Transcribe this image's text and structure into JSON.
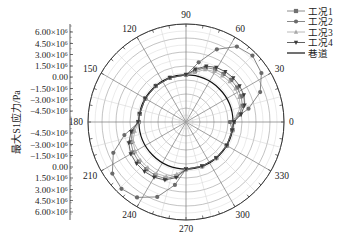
{
  "chart_data": {
    "type": "polar-line",
    "title": "",
    "radial_axis": {
      "label": "最大S1应力/Pa",
      "tick_labels_upper": [
        "6.00×10⁶",
        "4.50×10⁶",
        "3.00×10⁶",
        "1.50×10⁶",
        "0.00",
        "−1.50×10⁶",
        "−3.00×10⁶",
        "−4.50×10⁶"
      ],
      "tick_labels_lower": [
        "−4.50×10⁶",
        "−3.00×10⁶",
        "−1.50×10⁶",
        "0.00",
        "1.50×10⁶",
        "3.00×10⁶",
        "4.50×10⁶",
        "6.00×10⁶"
      ],
      "unit_scale": 1000000,
      "range": [
        -6.0,
        7.2
      ]
    },
    "angular_axis": {
      "tick_labels": [
        "0",
        "30",
        "60",
        "90",
        "120",
        "150",
        "180",
        "210",
        "240",
        "270",
        "300",
        "330"
      ],
      "tick_angles_deg": [
        0,
        30,
        60,
        90,
        120,
        150,
        180,
        210,
        240,
        270,
        300,
        330
      ],
      "direction": "counterclockwise"
    },
    "grid": true,
    "legend": {
      "position": "top-right",
      "entries": [
        "工况1",
        "工况2",
        "工况3",
        "工况4",
        "巷道"
      ]
    },
    "tunnel_value": 0.33,
    "series": [
      {
        "name": "工况1",
        "marker": "square",
        "color": "#707070",
        "points": [
          [
            0,
            0.4
          ],
          [
            8,
            1.3
          ],
          [
            16,
            1.9
          ],
          [
            25,
            2.2
          ],
          [
            34,
            2.3
          ],
          [
            43,
            2.3
          ],
          [
            52,
            2.2
          ],
          [
            61,
            2.1
          ],
          [
            70,
            1.8
          ],
          [
            80,
            1.0
          ],
          [
            90,
            0.35
          ],
          [
            110,
            0.33
          ],
          [
            130,
            0.33
          ],
          [
            150,
            0.33
          ],
          [
            170,
            0.33
          ],
          [
            180,
            0.4
          ],
          [
            190,
            1.3
          ],
          [
            200,
            1.9
          ],
          [
            210,
            2.2
          ],
          [
            220,
            2.3
          ],
          [
            230,
            2.3
          ],
          [
            240,
            2.3
          ],
          [
            250,
            2.1
          ],
          [
            260,
            1.4
          ],
          [
            270,
            0.35
          ],
          [
            290,
            0.33
          ],
          [
            310,
            0.33
          ],
          [
            330,
            0.33
          ],
          [
            350,
            0.33
          ],
          [
            360,
            0.4
          ]
        ]
      },
      {
        "name": "工况2",
        "marker": "circle",
        "color": "#6a6a6a",
        "points": [
          [
            0,
            -0.08
          ],
          [
            12,
            2.6
          ],
          [
            22,
            4.77
          ],
          [
            33,
            6.1
          ],
          [
            45,
            6.65
          ],
          [
            56,
            6.25
          ],
          [
            67,
            4.63
          ],
          [
            78,
            2.21
          ],
          [
            90,
            0.33
          ],
          [
            110,
            0.33
          ],
          [
            130,
            0.33
          ],
          [
            150,
            0.33
          ],
          [
            170,
            0.33
          ],
          [
            180,
            0.33
          ],
          [
            192,
            2.48
          ],
          [
            203,
            4.63
          ],
          [
            215,
            6.1
          ],
          [
            226,
            6.5
          ],
          [
            237,
            6.1
          ],
          [
            249,
            4.8
          ],
          [
            260,
            2.6
          ],
          [
            270,
            0.33
          ],
          [
            290,
            0.33
          ],
          [
            310,
            0.33
          ],
          [
            330,
            0.33
          ],
          [
            350,
            0.33
          ],
          [
            360,
            -0.08
          ]
        ]
      },
      {
        "name": "工况3",
        "marker": "triangle-up",
        "color": "#a8a8a8",
        "points": [
          [
            0,
            0.35
          ],
          [
            8,
            1.0
          ],
          [
            16,
            1.6
          ],
          [
            25,
            1.9
          ],
          [
            34,
            2.0
          ],
          [
            43,
            2.0
          ],
          [
            52,
            1.9
          ],
          [
            61,
            1.8
          ],
          [
            70,
            1.5
          ],
          [
            80,
            0.8
          ],
          [
            90,
            0.33
          ],
          [
            110,
            0.33
          ],
          [
            130,
            0.33
          ],
          [
            150,
            0.33
          ],
          [
            170,
            0.33
          ],
          [
            180,
            0.35
          ],
          [
            190,
            1.0
          ],
          [
            200,
            1.6
          ],
          [
            210,
            1.9
          ],
          [
            220,
            2.0
          ],
          [
            230,
            2.0
          ],
          [
            240,
            2.0
          ],
          [
            250,
            1.8
          ],
          [
            260,
            1.1
          ],
          [
            270,
            0.33
          ],
          [
            290,
            0.33
          ],
          [
            310,
            0.33
          ],
          [
            330,
            0.33
          ],
          [
            350,
            0.33
          ],
          [
            360,
            0.35
          ]
        ]
      },
      {
        "name": "工况4",
        "marker": "triangle-down",
        "color": "#3a3a3a",
        "points": [
          [
            0,
            0.45
          ],
          [
            8,
            1.5
          ],
          [
            16,
            2.2
          ],
          [
            25,
            2.6
          ],
          [
            34,
            2.7
          ],
          [
            43,
            2.7
          ],
          [
            52,
            2.6
          ],
          [
            61,
            2.4
          ],
          [
            70,
            2.0
          ],
          [
            80,
            1.2
          ],
          [
            90,
            0.35
          ],
          [
            110,
            0.33
          ],
          [
            130,
            0.33
          ],
          [
            150,
            0.33
          ],
          [
            170,
            0.33
          ],
          [
            180,
            0.45
          ],
          [
            190,
            1.5
          ],
          [
            200,
            2.2
          ],
          [
            210,
            2.6
          ],
          [
            220,
            2.7
          ],
          [
            230,
            2.7
          ],
          [
            240,
            2.6
          ],
          [
            250,
            2.3
          ],
          [
            260,
            1.6
          ],
          [
            270,
            0.35
          ],
          [
            290,
            0.33
          ],
          [
            310,
            0.33
          ],
          [
            330,
            0.33
          ],
          [
            350,
            0.33
          ],
          [
            360,
            0.45
          ]
        ]
      }
    ]
  }
}
